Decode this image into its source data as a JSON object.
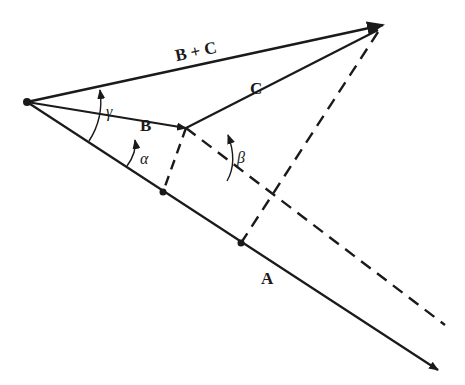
{
  "diagram": {
    "labels": {
      "sum": "B + C",
      "b": "B",
      "c": "C",
      "a": "A",
      "alpha": "α",
      "beta": "β",
      "gamma": "γ"
    },
    "colors": {
      "stroke": "#1a1a1a",
      "background": "#ffffff"
    },
    "points": {
      "origin": [
        27,
        102
      ],
      "b_tip": [
        186,
        128
      ],
      "sum_tip": [
        383,
        25
      ],
      "a_tip": [
        438,
        370
      ],
      "proj_b_on_a": [
        163,
        192
      ],
      "proj_sum_on_a": [
        241,
        243
      ],
      "b_extension_end": [
        445,
        325
      ]
    }
  }
}
